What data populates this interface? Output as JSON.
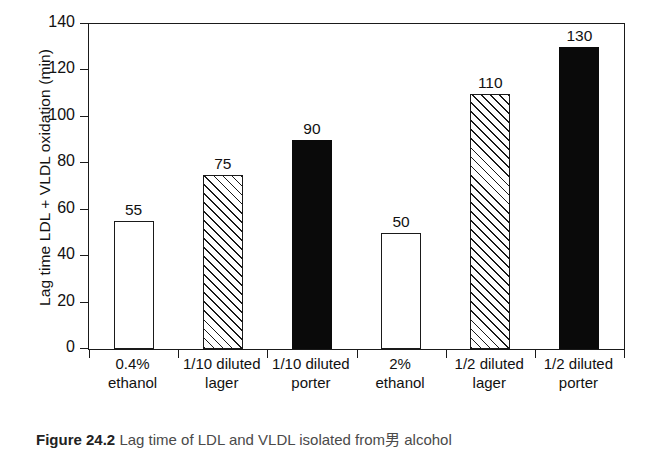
{
  "chart_data": {
    "type": "bar",
    "title": "",
    "xlabel": "",
    "ylabel": "Lag time LDL + VLDL oxidation (min)",
    "ylim": [
      0,
      140
    ],
    "yticks": [
      0,
      20,
      40,
      60,
      80,
      100,
      120,
      140
    ],
    "grid": false,
    "legend": "none",
    "categories": [
      "0.4% ethanol",
      "1/10 diluted lager",
      "1/10 diluted porter",
      "2% ethanol",
      "1/2 diluted lager",
      "1/2 diluted porter"
    ],
    "category_lines": [
      [
        "0.4%",
        "ethanol"
      ],
      [
        "1/10 diluted",
        "lager"
      ],
      [
        "1/10 diluted",
        "porter"
      ],
      [
        "2%",
        "ethanol"
      ],
      [
        "1/2 diluted",
        "lager"
      ],
      [
        "1/2 diluted",
        "porter"
      ]
    ],
    "values": [
      55,
      75,
      90,
      50,
      110,
      130
    ],
    "value_labels": [
      "55",
      "75",
      "90",
      "50",
      "110",
      "130"
    ],
    "bar_styles": [
      "white",
      "hatch",
      "black",
      "white",
      "hatch",
      "black"
    ]
  },
  "axis": {
    "y_title": "Lag time LDL + VLDL oxidation (min)",
    "y_tick_labels": [
      "0",
      "20",
      "40",
      "60",
      "80",
      "100",
      "120",
      "140"
    ]
  },
  "caption": {
    "label": "Figure 24.2",
    "text": "Lag time of LDL and VLDL isolated from男 alcohol"
  },
  "colors": {
    "axis": "#1a1a1a",
    "bar_black": "#0a0a0a",
    "bar_white": "#ffffff",
    "hatch": "#1a1a1a",
    "text": "#111111"
  }
}
